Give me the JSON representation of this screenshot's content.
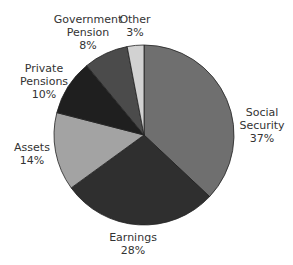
{
  "chart_data": {
    "type": "pie",
    "title": "",
    "start_angle_deg": 0,
    "direction": "clockwise",
    "center": [
      144,
      135
    ],
    "radius": 90,
    "slices": [
      {
        "name": "Social Security",
        "label_lines": [
          "Social",
          "Security"
        ],
        "value": 37,
        "value_label": "37%",
        "color": "#6f6f6f",
        "label_pos": [
          262,
          106
        ]
      },
      {
        "name": "Earnings",
        "label_lines": [
          "Earnings"
        ],
        "value": 28,
        "value_label": "28%",
        "color": "#2f2f2f",
        "label_pos": [
          133,
          231
        ]
      },
      {
        "name": "Assets",
        "label_lines": [
          "Assets"
        ],
        "value": 14,
        "value_label": "14%",
        "color": "#a3a3a3",
        "label_pos": [
          32,
          141
        ]
      },
      {
        "name": "Private Pensions",
        "label_lines": [
          "Private",
          "Pensions"
        ],
        "value": 10,
        "value_label": "10%",
        "color": "#1f1f1f",
        "label_pos": [
          44,
          62
        ]
      },
      {
        "name": "Government Pension",
        "label_lines": [
          "Government",
          "Pension"
        ],
        "value": 8,
        "value_label": "8%",
        "color": "#4b4b4b",
        "label_pos": [
          88,
          13
        ]
      },
      {
        "name": "Other",
        "label_lines": [
          "Other"
        ],
        "value": 3,
        "value_label": "3%",
        "color": "#d2d2d2",
        "label_pos": [
          135,
          13
        ]
      }
    ],
    "legend": "none",
    "labels_outside": true
  }
}
